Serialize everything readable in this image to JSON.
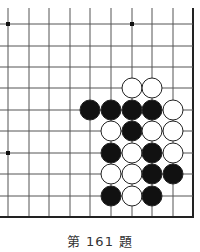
{
  "problem": {
    "caption": "第 161 題"
  },
  "board": {
    "cols_x": [
      8,
      29,
      49,
      70,
      90,
      111,
      132,
      152,
      173,
      193
    ],
    "rows_y": [
      24,
      46,
      67,
      88,
      110,
      131,
      153,
      174,
      196,
      217
    ],
    "top_extent": 8,
    "left_extent": 0,
    "right_edge_col": 9,
    "bottom_edge_row": 9,
    "line_color": "#555555",
    "edge_color": "#222222",
    "star_points": [
      [
        0,
        0
      ],
      [
        6,
        0
      ],
      [
        0,
        6
      ]
    ],
    "stone_radius": 10,
    "stones": [
      {
        "c": 6,
        "r": 3,
        "color": "white"
      },
      {
        "c": 7,
        "r": 3,
        "color": "white"
      },
      {
        "c": 4,
        "r": 4,
        "color": "black"
      },
      {
        "c": 5,
        "r": 4,
        "color": "black"
      },
      {
        "c": 6,
        "r": 4,
        "color": "black"
      },
      {
        "c": 7,
        "r": 4,
        "color": "black"
      },
      {
        "c": 8,
        "r": 4,
        "color": "white"
      },
      {
        "c": 5,
        "r": 5,
        "color": "white"
      },
      {
        "c": 6,
        "r": 5,
        "color": "black"
      },
      {
        "c": 7,
        "r": 5,
        "color": "white"
      },
      {
        "c": 8,
        "r": 5,
        "color": "white"
      },
      {
        "c": 5,
        "r": 6,
        "color": "black"
      },
      {
        "c": 6,
        "r": 6,
        "color": "white"
      },
      {
        "c": 7,
        "r": 6,
        "color": "black"
      },
      {
        "c": 8,
        "r": 6,
        "color": "white"
      },
      {
        "c": 5,
        "r": 7,
        "color": "white"
      },
      {
        "c": 6,
        "r": 7,
        "color": "white"
      },
      {
        "c": 7,
        "r": 7,
        "color": "black"
      },
      {
        "c": 8,
        "r": 7,
        "color": "black"
      },
      {
        "c": 5,
        "r": 8,
        "color": "black"
      },
      {
        "c": 6,
        "r": 8,
        "color": "white"
      },
      {
        "c": 7,
        "r": 8,
        "color": "black"
      }
    ]
  }
}
